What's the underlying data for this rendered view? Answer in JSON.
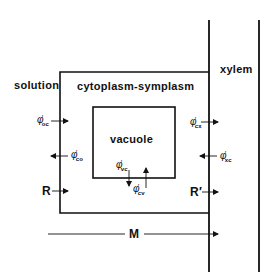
{
  "diagram": {
    "regions": {
      "solution": "solution",
      "cytoplasm": "cytoplasm-symplasm",
      "vacuole": "vacuole",
      "xylem": "xylem"
    },
    "fluxes": [
      {
        "id": "oc",
        "symbol": "φ",
        "prime": "′",
        "subscript": "oc",
        "direction": "right",
        "from": "solution",
        "to": "cytoplasm"
      },
      {
        "id": "co",
        "symbol": "φ",
        "prime": "′",
        "subscript": "co",
        "direction": "left",
        "from": "cytoplasm",
        "to": "solution"
      },
      {
        "id": "vc",
        "symbol": "φ",
        "prime": "′",
        "subscript": "vc",
        "direction": "down",
        "from": "vacuole",
        "to": "cytoplasm"
      },
      {
        "id": "cv",
        "symbol": "φ",
        "prime": "′",
        "subscript": "cv",
        "direction": "up",
        "from": "cytoplasm",
        "to": "vacuole"
      },
      {
        "id": "cx",
        "symbol": "φ",
        "prime": "′",
        "subscript": "cx",
        "direction": "right",
        "from": "cytoplasm",
        "to": "xylem"
      },
      {
        "id": "xc",
        "symbol": "φ",
        "prime": "′",
        "subscript": "xc",
        "direction": "left",
        "from": "xylem",
        "to": "cytoplasm"
      }
    ],
    "net_fluxes": {
      "R": "R",
      "R_prime": "R′",
      "M": "M"
    },
    "colors": {
      "line": "#111111",
      "background": "#ffffff"
    }
  }
}
